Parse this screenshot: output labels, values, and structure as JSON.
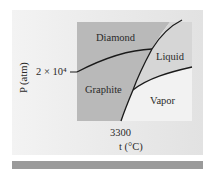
{
  "diagram": {
    "regions": [
      {
        "label": "Diamond"
      },
      {
        "label": "Liquid"
      },
      {
        "label": "Graphite"
      },
      {
        "label": "Vapor"
      }
    ],
    "y_axis": {
      "label": "P (atm)",
      "tick": "2 × 10⁴"
    },
    "x_axis": {
      "label": "t (°C)",
      "tick": "3300"
    },
    "colors": {
      "solid_region": "#b9b9b9",
      "liquid_region": "#d6d6d6",
      "vapor_region": "#f2f2f2",
      "curve": "#1a1a1a",
      "footer_bar": "#9a9a9a"
    }
  }
}
